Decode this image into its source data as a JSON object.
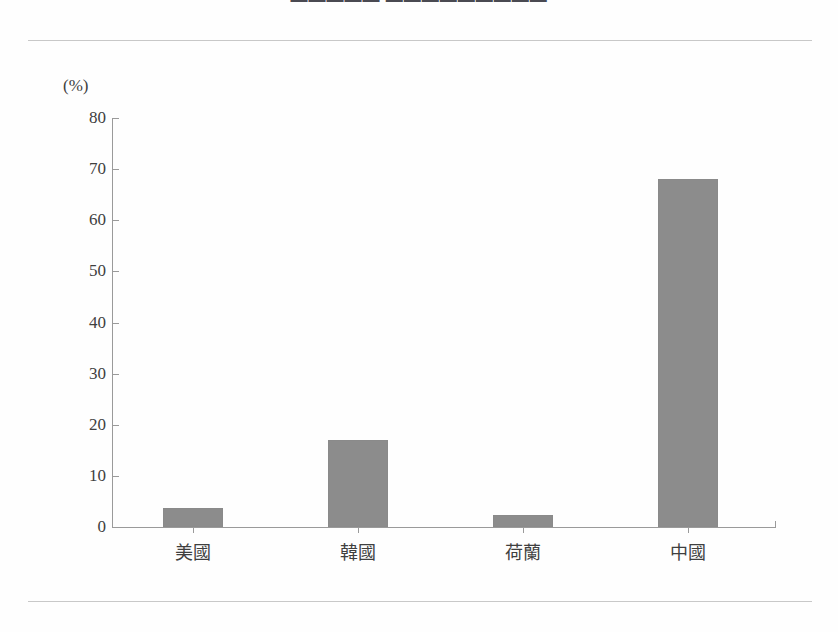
{
  "document": {
    "title_clipped": "▬▬▬▬▬ ▬▬▬▬▬▬▬▬▬",
    "background_color": "#fefefe",
    "rule_color": "#c8c8c8"
  },
  "chart_data": {
    "type": "bar",
    "title": "",
    "categories": [
      "美國",
      "韓國",
      "荷蘭",
      "中國"
    ],
    "values": [
      3.7,
      17.0,
      2.4,
      68.1
    ],
    "xlabel": "",
    "ylabel": "(%)",
    "ylim": [
      0,
      80
    ],
    "yticks": [
      0,
      10,
      20,
      30,
      40,
      50,
      60,
      70,
      80
    ],
    "ytick_labels": [
      "0",
      "10",
      "20",
      "30",
      "40",
      "50",
      "60",
      "70",
      "80"
    ],
    "grid": false,
    "legend": false,
    "bar_color": "#8c8c8c",
    "axis_color": "#9a9a9a"
  }
}
